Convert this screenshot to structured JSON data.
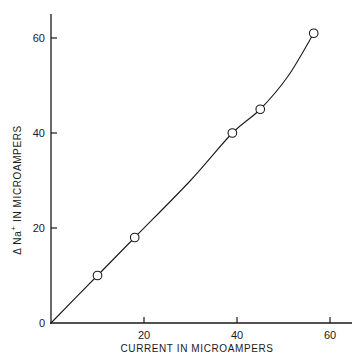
{
  "chart_data": {
    "type": "scatter",
    "title": "",
    "xlabel": "CURRENT IN MICROAMPERS",
    "ylabel_prefix": "Δ Na",
    "ylabel_superscript": "+",
    "ylabel_suffix": " IN MICROAMPERS",
    "xlim": [
      0,
      65
    ],
    "ylim": [
      0,
      65
    ],
    "x_ticks": [
      20,
      40,
      60
    ],
    "y_ticks": [
      0,
      20,
      40,
      60
    ],
    "x_tick_labels": [
      "20",
      "40",
      "60"
    ],
    "y_tick_labels": [
      "0",
      "20",
      "40",
      "60"
    ],
    "grid": false,
    "legend": "none",
    "marker": "open-circle",
    "series": [
      {
        "name": "measured",
        "points": [
          {
            "x": 10,
            "y": 10
          },
          {
            "x": 18,
            "y": 18
          },
          {
            "x": 39,
            "y": 40
          },
          {
            "x": 45,
            "y": 45
          },
          {
            "x": 56.5,
            "y": 61
          }
        ]
      }
    ],
    "fit_curve": {
      "description": "smooth curve from origin through points",
      "points": [
        {
          "x": 0,
          "y": 0
        },
        {
          "x": 10,
          "y": 10
        },
        {
          "x": 18,
          "y": 18
        },
        {
          "x": 30,
          "y": 30
        },
        {
          "x": 39,
          "y": 40
        },
        {
          "x": 45,
          "y": 45
        },
        {
          "x": 51,
          "y": 52
        },
        {
          "x": 56.5,
          "y": 61
        }
      ]
    }
  }
}
